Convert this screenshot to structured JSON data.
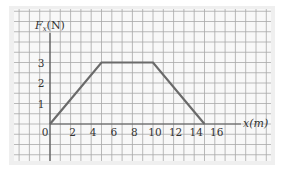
{
  "chart_data": {
    "type": "line",
    "title": "",
    "xlabel": "x(m)",
    "ylabel": "Fx(N)",
    "x": [
      0,
      5,
      10,
      15
    ],
    "series": [
      {
        "name": "Fx",
        "values": [
          0,
          3,
          3,
          0
        ]
      }
    ],
    "x_ticks": [
      0,
      2,
      4,
      6,
      8,
      10,
      12,
      14,
      16
    ],
    "y_ticks": [
      1,
      2,
      3
    ],
    "xlim": [
      -4,
      21
    ],
    "ylim": [
      -2,
      5.5
    ],
    "grid": true,
    "legend": null
  },
  "labels": {
    "y_axis_main": "F",
    "y_axis_sub": "x",
    "y_axis_unit": "(N)",
    "x_axis": "x(m)"
  },
  "colors": {
    "panel_bg": "#f6f6f6",
    "grid": "#a8a8a8",
    "axis": "#555555",
    "line": "#6a6a6a",
    "text": "#333333"
  }
}
